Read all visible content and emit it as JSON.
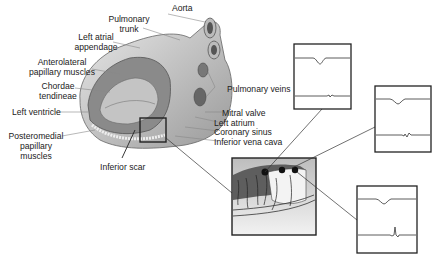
{
  "diagram": {
    "labels": {
      "aorta": "Aorta",
      "pulmonary_trunk_1": "Pulmonary",
      "pulmonary_trunk_2": "trunk",
      "left_atrial_appendage_1": "Left atrial",
      "left_atrial_appendage_2": "appendage",
      "anterolateral_1": "Anterolateral",
      "anterolateral_2": "papillary muscles",
      "chordae_1": "Chordae",
      "chordae_2": "tendineae",
      "left_ventricle": "Left ventricle",
      "posteromedial_1": "Posteromedial",
      "posteromedial_2": "papillary",
      "posteromedial_3": "muscles",
      "inferior_scar": "Inferior scar",
      "pulmonary_veins": "Pulmonary veins",
      "mitral_valve": "Mitral valve",
      "left_atrium": "Left atrium",
      "coronary_sinus": "Coronary sinus",
      "inferior_vena_cava": "Inferior vena cava"
    },
    "electrograms": [
      {
        "id": "egm-1",
        "top_trace": "surface ECG",
        "bottom_trace": "low-amplitude fractionated"
      },
      {
        "id": "egm-2",
        "top_trace": "surface ECG",
        "bottom_trace": "low-amplitude fractionated"
      },
      {
        "id": "egm-3",
        "top_trace": "surface ECG",
        "bottom_trace": "sharp late potential"
      }
    ],
    "colors": {
      "line": "#333333",
      "fill_dark": "#555555",
      "fill_light": "#cfcfcf"
    }
  }
}
